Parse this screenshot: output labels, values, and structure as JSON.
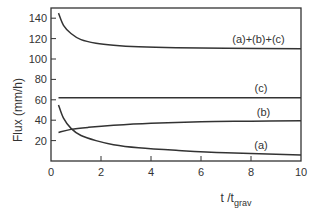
{
  "chart_data": {
    "type": "line",
    "title": "",
    "xlabel": "t /t_grav",
    "xlabel_main": "t /t",
    "xlabel_sub": "grav",
    "ylabel": "Flux (mm/h)",
    "xlim": [
      0,
      10
    ],
    "ylim": [
      0,
      150
    ],
    "x_ticks": [
      0,
      2,
      4,
      6,
      8,
      10
    ],
    "y_ticks": [
      20,
      40,
      60,
      80,
      100,
      120,
      140
    ],
    "x_tick_labels": [
      "0",
      "2",
      "4",
      "6",
      "8",
      "10"
    ],
    "y_tick_labels": [
      "20",
      "40",
      "60",
      "80",
      "100",
      "120",
      "140"
    ],
    "grid": false,
    "legend": "inline labels near right end of each curve",
    "series": [
      {
        "name": "(a)+(b)+(c)",
        "x": [
          0.3,
          0.5,
          0.8,
          1.2,
          1.8,
          2.5,
          3.5,
          5,
          7,
          10
        ],
        "values": [
          145,
          133,
          125,
          119,
          115.5,
          113.5,
          112,
          111,
          110.5,
          110
        ]
      },
      {
        "name": "(c)",
        "x": [
          0.3,
          0.5,
          1,
          2,
          4,
          6,
          8,
          10
        ],
        "values": [
          62,
          62,
          62,
          62,
          62,
          62,
          62,
          62
        ]
      },
      {
        "name": "(b)",
        "x": [
          0.3,
          0.8,
          1.5,
          2.5,
          4,
          6,
          8,
          10
        ],
        "values": [
          28,
          31,
          33,
          35,
          37,
          38.5,
          39,
          39.5
        ]
      },
      {
        "name": "(a)",
        "x": [
          0.3,
          0.5,
          0.8,
          1.2,
          1.8,
          2.5,
          3.5,
          5,
          7,
          10
        ],
        "values": [
          55,
          42,
          32,
          25,
          20,
          16,
          13,
          10.5,
          8,
          6
        ]
      }
    ]
  }
}
